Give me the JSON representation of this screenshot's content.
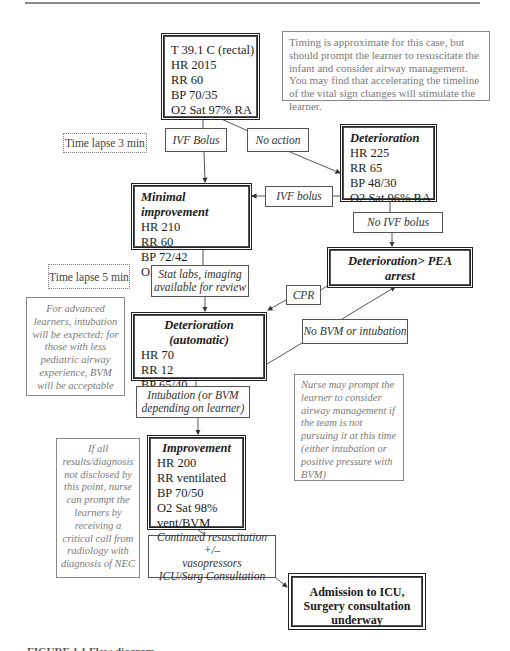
{
  "flowchart": {
    "initial_state": {
      "lines": [
        "T 39.1 C (rectal)",
        "HR 2015",
        "RR 60",
        "BP 70/35",
        "O2 Sat 97% RA"
      ]
    },
    "timing_note": "Timing is approximate for this case, but should prompt the learner to resuscitate the infant and consider airway management. You may find that accelerating the timeline of the vital sign changes will stimulate the learner.",
    "time_lapse_1": "Time lapse 3 min",
    "action_ivf_bolus_1": "IVF Bolus",
    "action_no_action": "No action",
    "deterioration_1": {
      "title": "Deterioration",
      "lines": [
        "HR 225",
        "RR 65",
        "BP 48/30",
        "O2 Sat 96% RA"
      ]
    },
    "minimal_improvement": {
      "title": "Minimal improvement",
      "lines": [
        "HR 210",
        "RR 60",
        "BP 72/42",
        "O2 Sat 97%"
      ]
    },
    "action_ivf_bolus_2": "IVF bolus",
    "action_no_ivf_bolus": "No IVF bolus",
    "pea_arrest": {
      "title": "Deterioration> PEA arrest"
    },
    "time_lapse_2": "Time lapse 5 min",
    "action_stat_labs": [
      "Stat labs, imaging",
      "available for review"
    ],
    "action_cpr": "CPR",
    "advanced_learners_note": "For advanced learners, intubation will be expected; for those with less pediatric airway experience, BVM will be acceptable",
    "deterioration_auto": {
      "title": "Deterioration (automatic)",
      "lines": [
        "HR 70",
        "RR 12",
        "BP 65/40",
        "O2 Sat 91%"
      ]
    },
    "action_no_bvm": "No BVM or intubation",
    "action_intubation": [
      "Intubation (or BVM",
      "depending on learner)"
    ],
    "nurse_note": "Nurse may prompt the learner to consider airway management if the team is not pursuing it at this time (either intubation or positive pressure with BVM)",
    "results_note": "If all results/diagnosis not disclosed by this point, nurse can prompt the learners by receiving a critical call from radiology with diagnosis of NEC",
    "improvement": {
      "title": "Improvement",
      "lines": [
        "HR 200",
        "RR ventilated",
        "BP 70/50",
        "O2 Sat 98%",
        "vent/BVM"
      ]
    },
    "action_continued": [
      "Continued resuscitation +/–",
      "vasopressors",
      "ICU/Surg Consultation"
    ],
    "final_state": "Admission to ICU, Surgery consultation underway"
  },
  "caption": "FIGURE 1.1  Flow diagram"
}
